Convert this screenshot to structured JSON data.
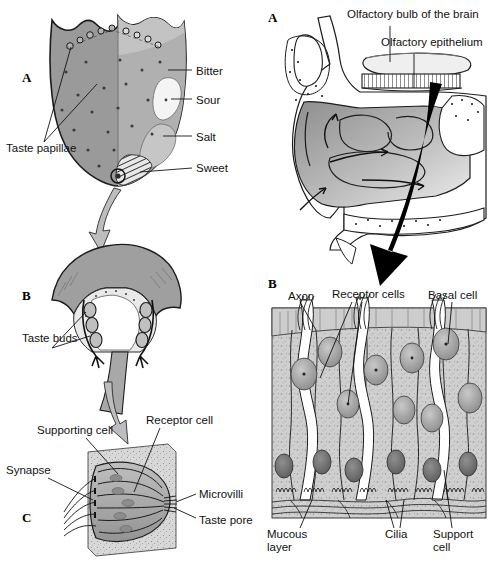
{
  "figure": {
    "style": "grayscale line-and-tone textbook illustration",
    "panels": [
      {
        "id": "left-A",
        "letter": "A",
        "subject": "tongue dorsal surface with taste zones"
      },
      {
        "id": "left-B",
        "letter": "B",
        "subject": "circumvallate papilla cross-section"
      },
      {
        "id": "left-C",
        "letter": "C",
        "subject": "taste bud detail"
      },
      {
        "id": "right-A",
        "letter": "A",
        "subject": "sagittal nasal cavity"
      },
      {
        "id": "right-B",
        "letter": "B",
        "subject": "olfactory epithelium cells"
      }
    ]
  },
  "tongue": {
    "panel_letter": "A",
    "zone_labels": [
      {
        "text": "Bitter",
        "x": 196,
        "y": 67
      },
      {
        "text": "Sour",
        "x": 196,
        "y": 96
      },
      {
        "text": "Salt",
        "x": 196,
        "y": 133
      },
      {
        "text": "Sweet",
        "x": 196,
        "y": 164
      }
    ],
    "papillae_label": "Taste papillae"
  },
  "papilla": {
    "panel_letter": "B",
    "label": "Taste buds"
  },
  "tastebud": {
    "panel_letter": "C",
    "labels": [
      {
        "text": "Supporting cell",
        "x": 37,
        "y": 428
      },
      {
        "text": "Receptor cell",
        "x": 146,
        "y": 418
      },
      {
        "text": "Synapse",
        "x": 8,
        "y": 468
      },
      {
        "text": "Microvilli",
        "x": 200,
        "y": 492
      },
      {
        "text": "Taste pore",
        "x": 200,
        "y": 518
      }
    ]
  },
  "nasal": {
    "panel_letter": "A",
    "labels": [
      {
        "text": "Olfactory bulb of the brain",
        "x": 348,
        "y": 12
      },
      {
        "text": "Olfactory epithelium",
        "x": 382,
        "y": 40
      }
    ]
  },
  "epithelium": {
    "panel_letter": "B",
    "top_labels": [
      {
        "text": "Axon",
        "x": 289,
        "y": 295
      },
      {
        "text": "Receptor cells",
        "x": 333,
        "y": 292
      },
      {
        "text": "Basal cell",
        "x": 430,
        "y": 293
      }
    ],
    "bottom_labels": [
      {
        "text": "Mucous layer",
        "x": 268,
        "y": 532
      },
      {
        "text": "Cilia",
        "x": 386,
        "y": 532
      },
      {
        "text": "Support cell",
        "x": 434,
        "y": 532
      }
    ]
  },
  "colors": {
    "ink": "#111111",
    "tongue_body": "#9a9a9a",
    "tongue_back": "#b9b9b9",
    "sour_patch": "#f2f2f2",
    "salt_patch": "#c2c2c2",
    "tissue_light": "#dcdcdc",
    "arrow_gray": "#b0b0b0",
    "arrow_black": "#000000"
  }
}
